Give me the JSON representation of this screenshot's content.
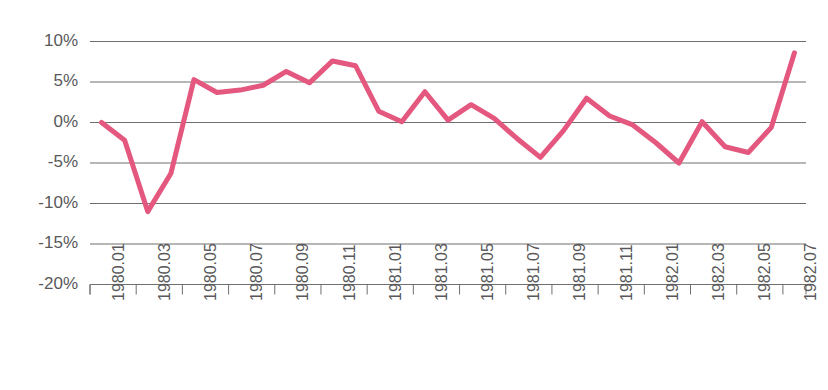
{
  "chart_data": {
    "type": "line",
    "title": "",
    "xlabel": "",
    "ylabel": "",
    "ylim": [
      -20,
      10
    ],
    "ytick_values": [
      10,
      5,
      0,
      -5,
      -10,
      -15,
      -20
    ],
    "ytick_labels": [
      "10%",
      "5%",
      "0%",
      "-5%",
      "-10%",
      "-15%",
      "-20%"
    ],
    "grid": true,
    "legend": "none",
    "line_color": "#e4577f",
    "grid_color": "#6f6f6f",
    "axis_color": "#6f6f6f",
    "label_color": "#58585a",
    "x": [
      "1980.01",
      "1980.02",
      "1980.03",
      "1980.04",
      "1980.05",
      "1980.06",
      "1980.07",
      "1980.08",
      "1980.09",
      "1980.10",
      "1980.11",
      "1980.12",
      "1981.01",
      "1981.02",
      "1981.03",
      "1981.04",
      "1981.05",
      "1981.06",
      "1981.07",
      "1981.08",
      "1981.09",
      "1981.10",
      "1981.11",
      "1981.12",
      "1982.01",
      "1982.02",
      "1982.03",
      "1982.04",
      "1982.05",
      "1982.06",
      "1982.07"
    ],
    "xtick_labels": [
      "1980.01",
      "1980.03",
      "1980.05",
      "1980.07",
      "1980.09",
      "1980.11",
      "1981.01",
      "1981.03",
      "1981.05",
      "1981.07",
      "1981.09",
      "1981.11",
      "1982.01",
      "1982.03",
      "1982.05",
      "1982.07"
    ],
    "xtick_indices": [
      0,
      2,
      4,
      6,
      8,
      10,
      12,
      14,
      16,
      18,
      20,
      22,
      24,
      26,
      28,
      30
    ],
    "values": [
      0.0,
      -2.2,
      -11.0,
      -6.3,
      5.3,
      3.7,
      4.0,
      4.6,
      6.3,
      4.9,
      7.6,
      7.0,
      1.4,
      0.1,
      3.8,
      0.3,
      2.2,
      0.5,
      -2.0,
      -4.3,
      -1.0,
      3.0,
      0.8,
      -0.3,
      -2.5,
      -5.0,
      0.1,
      -3.0,
      -3.7,
      -0.6,
      8.6
    ]
  }
}
